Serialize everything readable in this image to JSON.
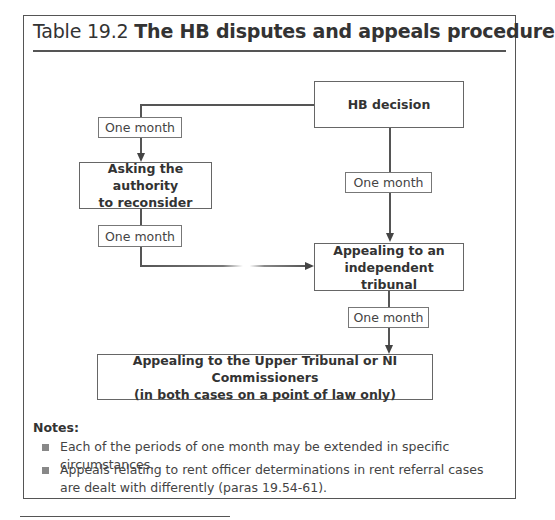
{
  "title": {
    "prefix": "Table 19.2 ",
    "bold": "The HB disputes and appeals procedure"
  },
  "flowchart": {
    "nodes": {
      "hb_decision": "HB decision",
      "ask_reconsider_line1": "Asking the authority",
      "ask_reconsider_line2": "to reconsider",
      "tribunal_line1": "Appealing to an",
      "tribunal_line2": "independent tribunal",
      "upper_line1": "Appealing to the Upper Tribunal or NI Commissioners",
      "upper_line2": "(in both cases on a point of law only)"
    },
    "periods": {
      "decision_to_reconsider": "One month",
      "decision_to_tribunal": "One month",
      "reconsider_to_tribunal": "One month",
      "tribunal_to_upper": "One month"
    }
  },
  "notes": {
    "heading": "Notes:",
    "items": [
      "Each of the periods of one month may be extended in specific circumstances.",
      "Appeals relating to rent officer determinations in rent referral cases are dealt with differently (paras 19.54-61)."
    ]
  }
}
